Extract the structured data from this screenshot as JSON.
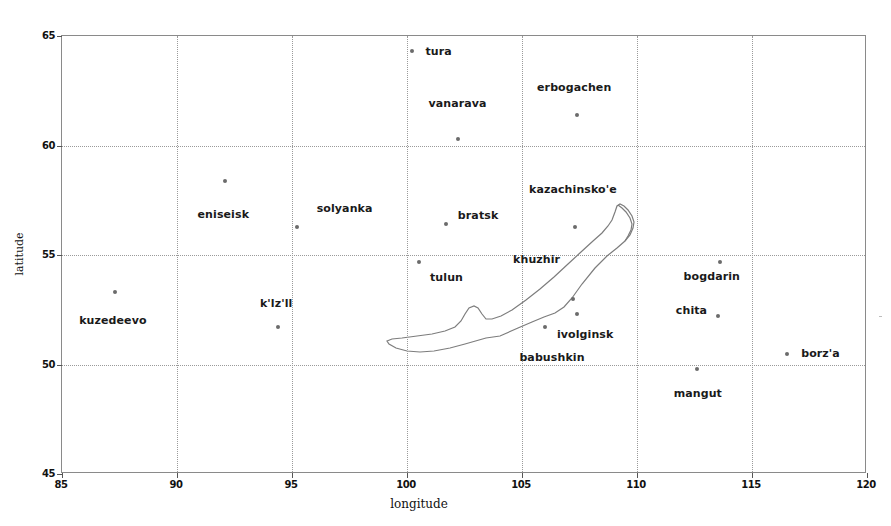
{
  "chart_data": {
    "type": "scatter",
    "title": "",
    "xlabel": "longitude",
    "ylabel": "latitude",
    "xlim": [
      85,
      120
    ],
    "ylim": [
      45,
      65
    ],
    "xticks": [
      85,
      90,
      95,
      100,
      105,
      110,
      115,
      120
    ],
    "yticks": [
      45,
      50,
      55,
      60,
      65
    ],
    "grid": true,
    "legend": "none",
    "marker_color": "#6b6b6b",
    "points": [
      {
        "name": "tura",
        "x": 100.2,
        "y": 64.3,
        "label_dx": 27,
        "label_dy": 0
      },
      {
        "name": "vanarava",
        "x": 102.2,
        "y": 60.3,
        "label_dx": 0,
        "label_dy": -36
      },
      {
        "name": "erbogachen",
        "x": 107.4,
        "y": 61.4,
        "label_dx": -3,
        "label_dy": -28
      },
      {
        "name": "eniseisk",
        "x": 92.1,
        "y": 58.4,
        "label_dx": -2,
        "label_dy": 33
      },
      {
        "name": "kazachinsko'e",
        "x": 107.3,
        "y": 56.3,
        "label_dx": -2,
        "label_dy": -38
      },
      {
        "name": "solyanka",
        "x": 95.2,
        "y": 56.3,
        "label_dx": 48,
        "label_dy": -19
      },
      {
        "name": "bratsk",
        "x": 101.7,
        "y": 56.4,
        "label_dx": 32,
        "label_dy": -9
      },
      {
        "name": "tulun",
        "x": 100.5,
        "y": 54.7,
        "label_dx": 28,
        "label_dy": 15
      },
      {
        "name": "khuzhir",
        "x": 107.2,
        "y": 53.0,
        "label_dx": -36,
        "label_dy": -40
      },
      {
        "name": "kuzedeevo",
        "x": 87.3,
        "y": 53.3,
        "label_dx": -2,
        "label_dy": 28
      },
      {
        "name": "bogdarin",
        "x": 113.6,
        "y": 54.7,
        "label_dx": -8,
        "label_dy": 14
      },
      {
        "name": "chita",
        "x": 113.5,
        "y": 52.2,
        "label_dx": -26,
        "label_dy": -6
      },
      {
        "name": "k'lz'll",
        "x": 94.4,
        "y": 51.7,
        "label_dx": -2,
        "label_dy": -24
      },
      {
        "name": "ivolginsk",
        "x": 107.4,
        "y": 52.3,
        "label_dx": 8,
        "label_dy": 20
      },
      {
        "name": "babushkin",
        "x": 106.0,
        "y": 51.7,
        "label_dx": 7,
        "label_dy": 30
      },
      {
        "name": "borz'a",
        "x": 116.5,
        "y": 50.5,
        "label_dx": 34,
        "label_dy": -1
      },
      {
        "name": "mangut",
        "x": 112.6,
        "y": 49.8,
        "label_dx": 1,
        "label_dy": 24
      }
    ],
    "annotations": [
      {
        "name": "lake-baikal-outline",
        "kind": "polygon-outline",
        "color": "#7d7d7d"
      }
    ]
  }
}
